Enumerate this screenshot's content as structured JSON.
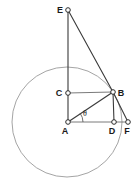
{
  "figure": {
    "kind": "plane-geometry-diagram",
    "width": 137,
    "height": 182,
    "background_color": "#ffffff",
    "stroke_color": "#3a3a3a",
    "circle_color": "#9a9a9a",
    "label_color": "#1a1a1a"
  },
  "labels": {
    "E": "E",
    "C": "C",
    "B": "B",
    "A": "A",
    "D": "D",
    "F": "F",
    "theta": "θ"
  },
  "points": {
    "E": {
      "name": "E",
      "x": 68,
      "y": 10,
      "label_x": 60,
      "label_y": 13
    },
    "C": {
      "name": "C",
      "x": 68,
      "y": 93,
      "label_x": 59,
      "label_y": 96
    },
    "B": {
      "name": "B",
      "x": 113,
      "y": 92,
      "label_x": 120,
      "label_y": 96
    },
    "A": {
      "name": "A",
      "x": 68,
      "y": 122,
      "label_x": 64,
      "label_y": 134
    },
    "D": {
      "name": "D",
      "x": 114,
      "y": 122,
      "label_x": 110,
      "label_y": 134
    },
    "F": {
      "name": "F",
      "x": 128,
      "y": 122,
      "label_x": 124,
      "label_y": 134
    }
  },
  "circle": {
    "name": "circle-centered-at-A",
    "center_x": 67,
    "center_y": 122,
    "radius": 55
  },
  "segments": [
    {
      "name": "segment-EA",
      "from": "E",
      "to": "A"
    },
    {
      "name": "segment-EB",
      "from": "E",
      "to": "B"
    },
    {
      "name": "segment-CB",
      "from": "C",
      "to": "B"
    },
    {
      "name": "segment-AB",
      "from": "A",
      "to": "B"
    },
    {
      "name": "segment-AF",
      "from": "A",
      "to": "F"
    },
    {
      "name": "segment-BD",
      "from": "B",
      "to": "D"
    },
    {
      "name": "segment-BF",
      "from": "B",
      "to": "F"
    }
  ],
  "angle": {
    "name": "angle-theta-at-A",
    "vertex": "A",
    "symbol": "θ",
    "label_x": 85,
    "label_y": 116,
    "arc_radius": 15
  }
}
